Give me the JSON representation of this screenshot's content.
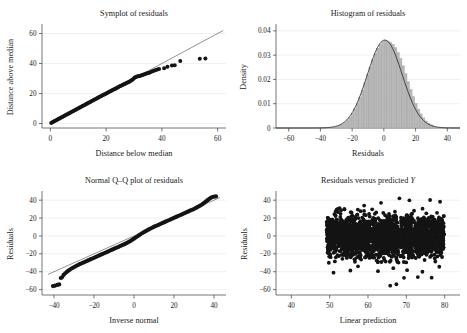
{
  "figure": {
    "background": "#ffffff",
    "point_color": "#141414",
    "bar_color": "#b8b8b8",
    "bar_edge": "#9a9a9a",
    "line_color": "#4a4a4a"
  },
  "panels": {
    "symplot": {
      "title": "Symplot of residuals"
    },
    "histogram": {
      "title": "Histogram of residuals"
    },
    "qq": {
      "title": "Normal Q–Q plot of residuals"
    },
    "scatter": {
      "title_before": "Residuals versus predicted ",
      "title_italic": "Y"
    }
  },
  "chart_data": [
    {
      "type": "scatter",
      "name": "symplot",
      "title": "Symplot of residuals",
      "xlabel": "Distance below median",
      "ylabel": "Distance above median",
      "xlim": [
        -3,
        63
      ],
      "ylim": [
        -3,
        65
      ],
      "xticks": [
        0,
        20,
        40,
        60
      ],
      "yticks": [
        0,
        20,
        40,
        60
      ],
      "grid": true,
      "reference_line": {
        "slope": 1,
        "intercept": 0,
        "label": "y = x"
      },
      "points": [
        [
          0.3,
          0.4
        ],
        [
          0.7,
          0.8
        ],
        [
          1.1,
          1.2
        ],
        [
          1.5,
          1.6
        ],
        [
          1.9,
          2.0
        ],
        [
          2.3,
          2.4
        ],
        [
          2.7,
          2.8
        ],
        [
          3.1,
          3.2
        ],
        [
          3.5,
          3.6
        ],
        [
          3.9,
          4.0
        ],
        [
          4.3,
          4.4
        ],
        [
          4.7,
          4.8
        ],
        [
          5.1,
          5.2
        ],
        [
          5.5,
          5.6
        ],
        [
          5.9,
          6.0
        ],
        [
          6.3,
          6.4
        ],
        [
          6.7,
          6.8
        ],
        [
          7.1,
          7.2
        ],
        [
          7.5,
          7.6
        ],
        [
          7.9,
          8.0
        ],
        [
          8.3,
          8.4
        ],
        [
          8.7,
          8.8
        ],
        [
          9.1,
          9.2
        ],
        [
          9.5,
          9.6
        ],
        [
          9.9,
          10.0
        ],
        [
          10.3,
          10.4
        ],
        [
          10.7,
          10.8
        ],
        [
          11.1,
          11.2
        ],
        [
          11.5,
          11.6
        ],
        [
          11.9,
          12.0
        ],
        [
          12.3,
          12.4
        ],
        [
          12.7,
          12.8
        ],
        [
          13.1,
          13.2
        ],
        [
          13.5,
          13.6
        ],
        [
          13.9,
          14.0
        ],
        [
          14.3,
          14.4
        ],
        [
          14.7,
          14.8
        ],
        [
          15.1,
          15.2
        ],
        [
          15.5,
          15.6
        ],
        [
          15.9,
          16.0
        ],
        [
          16.3,
          16.4
        ],
        [
          16.7,
          16.8
        ],
        [
          17.1,
          17.2
        ],
        [
          17.5,
          17.6
        ],
        [
          17.9,
          18.0
        ],
        [
          18.3,
          18.4
        ],
        [
          18.7,
          18.8
        ],
        [
          19.1,
          19.2
        ],
        [
          19.5,
          19.5
        ],
        [
          19.9,
          19.9
        ],
        [
          20.3,
          20.3
        ],
        [
          20.7,
          20.7
        ],
        [
          21.1,
          21.1
        ],
        [
          21.5,
          21.5
        ],
        [
          21.9,
          21.9
        ],
        [
          22.3,
          22.3
        ],
        [
          22.7,
          22.7
        ],
        [
          23.1,
          23.0
        ],
        [
          23.5,
          23.4
        ],
        [
          23.9,
          23.8
        ],
        [
          24.3,
          24.2
        ],
        [
          24.7,
          24.6
        ],
        [
          25.1,
          25.0
        ],
        [
          25.5,
          25.3
        ],
        [
          25.9,
          25.7
        ],
        [
          26.3,
          26.1
        ],
        [
          26.7,
          26.4
        ],
        [
          27.1,
          26.8
        ],
        [
          27.5,
          27.2
        ],
        [
          27.9,
          27.5
        ],
        [
          28.3,
          27.9
        ],
        [
          28.7,
          28.3
        ],
        [
          29.1,
          28.8
        ],
        [
          29.5,
          29.4
        ],
        [
          29.9,
          30.0
        ],
        [
          30.3,
          30.6
        ],
        [
          30.7,
          31.0
        ],
        [
          31.1,
          31.3
        ],
        [
          31.5,
          31.5
        ],
        [
          31.9,
          31.7
        ],
        [
          32.3,
          31.9
        ],
        [
          32.7,
          32.1
        ],
        [
          33.1,
          32.4
        ],
        [
          33.5,
          32.7
        ],
        [
          34.0,
          33.0
        ],
        [
          34.5,
          33.3
        ],
        [
          35.0,
          33.6
        ],
        [
          35.5,
          33.9
        ],
        [
          36.0,
          34.3
        ],
        [
          36.6,
          34.8
        ],
        [
          37.2,
          35.2
        ],
        [
          37.8,
          35.6
        ],
        [
          38.4,
          36.0
        ],
        [
          39.0,
          36.4
        ],
        [
          40.8,
          36.9
        ],
        [
          42.0,
          37.9
        ],
        [
          43.6,
          38.6
        ],
        [
          44.6,
          38.9
        ],
        [
          46.6,
          41.6
        ],
        [
          53.6,
          43.2
        ],
        [
          55.6,
          43.4
        ]
      ]
    },
    {
      "type": "bar",
      "name": "histogram",
      "title": "Histogram of residuals",
      "xlabel": "Residuals",
      "ylabel": "Density",
      "xlim": [
        -68,
        48
      ],
      "ylim": [
        0,
        0.042
      ],
      "xticks": [
        -60,
        -40,
        -20,
        0,
        20,
        40
      ],
      "yticks": [
        0,
        0.01,
        0.02,
        0.03,
        0.04
      ],
      "ytick_labels": [
        "0",
        "0.01",
        "0.02",
        "0.03",
        "0.04"
      ],
      "grid": true,
      "bin_width": 1.6,
      "bin_centers": [
        -31,
        -29.4,
        -27.8,
        -26.2,
        -24.6,
        -23,
        -21.4,
        -19.8,
        -18.2,
        -16.6,
        -15,
        -13.4,
        -11.8,
        -10.2,
        -8.6,
        -7,
        -5.4,
        -3.8,
        -2.2,
        -0.6,
        1,
        2.6,
        4.2,
        5.8,
        7.4,
        9,
        10.6,
        12.2,
        13.8,
        15.4,
        17,
        18.6,
        20.2,
        21.8,
        23.4,
        25,
        26.6,
        28.2,
        29.8,
        31.4
      ],
      "densities": [
        0.0004,
        0.0007,
        0.0011,
        0.0016,
        0.0023,
        0.0033,
        0.0045,
        0.006,
        0.0079,
        0.0101,
        0.0127,
        0.0156,
        0.0187,
        0.0219,
        0.0251,
        0.0281,
        0.0307,
        0.0328,
        0.0345,
        0.0356,
        0.0362,
        0.0358,
        0.0352,
        0.0345,
        0.0331,
        0.0311,
        0.0286,
        0.0256,
        0.0224,
        0.0191,
        0.0159,
        0.0129,
        0.0102,
        0.0078,
        0.0058,
        0.0042,
        0.0029,
        0.002,
        0.0013,
        0.0008
      ],
      "overlay": {
        "type": "normal_density",
        "mean": 0.6,
        "sd": 11.0,
        "peak": 0.0362
      }
    },
    {
      "type": "scatter",
      "name": "qq",
      "title": "Normal Q–Q plot of residuals",
      "xlabel": "Inverse normal",
      "ylabel": "Residuals",
      "xlim": [
        -46,
        46
      ],
      "ylim": [
        -66,
        48
      ],
      "xticks": [
        -40,
        -20,
        0,
        20,
        40
      ],
      "yticks": [
        -60,
        -40,
        -20,
        0,
        20,
        40
      ],
      "grid": true,
      "reference_line": {
        "slope": 1.0,
        "intercept": 0,
        "label": "45-degree reference"
      },
      "points": [
        [
          -40.5,
          -56.0
        ],
        [
          -39.5,
          -55.6
        ],
        [
          -38.2,
          -54.6
        ],
        [
          -37.4,
          -54.2
        ],
        [
          -36.6,
          -47.0
        ],
        [
          -36.0,
          -46.2
        ],
        [
          -35.2,
          -43.6
        ],
        [
          -34.4,
          -41.8
        ],
        [
          -33.6,
          -40.2
        ],
        [
          -32.8,
          -38.8
        ],
        [
          -32.0,
          -37.6
        ],
        [
          -31.2,
          -36.4
        ],
        [
          -30.4,
          -35.4
        ],
        [
          -29.6,
          -34.4
        ],
        [
          -28.8,
          -33.4
        ],
        [
          -28.0,
          -32.5
        ],
        [
          -27.2,
          -31.6
        ],
        [
          -26.4,
          -30.8
        ],
        [
          -25.6,
          -30.0
        ],
        [
          -24.8,
          -29.2
        ],
        [
          -24.0,
          -28.4
        ],
        [
          -23.2,
          -27.6
        ],
        [
          -22.4,
          -26.8
        ],
        [
          -21.6,
          -26.0
        ],
        [
          -20.8,
          -25.2
        ],
        [
          -20.0,
          -24.4
        ],
        [
          -19.2,
          -23.6
        ],
        [
          -18.4,
          -22.8
        ],
        [
          -17.6,
          -22.0
        ],
        [
          -16.8,
          -21.2
        ],
        [
          -16.0,
          -20.4
        ],
        [
          -15.2,
          -19.6
        ],
        [
          -14.4,
          -18.8
        ],
        [
          -13.6,
          -18.0
        ],
        [
          -12.8,
          -17.2
        ],
        [
          -12.0,
          -16.4
        ],
        [
          -11.2,
          -15.6
        ],
        [
          -10.4,
          -14.8
        ],
        [
          -9.6,
          -14.0
        ],
        [
          -8.8,
          -13.2
        ],
        [
          -8.0,
          -12.4
        ],
        [
          -7.2,
          -11.6
        ],
        [
          -6.4,
          -10.8
        ],
        [
          -5.6,
          -10.0
        ],
        [
          -4.8,
          -9.2
        ],
        [
          -4.0,
          -8.4
        ],
        [
          -3.2,
          -7.4
        ],
        [
          -2.4,
          -6.4
        ],
        [
          -1.6,
          -5.4
        ],
        [
          -0.8,
          -4.2
        ],
        [
          0,
          -3.0
        ],
        [
          0.8,
          -1.8
        ],
        [
          1.6,
          -0.6
        ],
        [
          2.4,
          0.6
        ],
        [
          3.2,
          1.8
        ],
        [
          4.0,
          3.0
        ],
        [
          4.8,
          4.0
        ],
        [
          5.6,
          5.0
        ],
        [
          6.4,
          6.0
        ],
        [
          7.2,
          7.0
        ],
        [
          8.0,
          8.0
        ],
        [
          8.8,
          8.9
        ],
        [
          9.6,
          9.8
        ],
        [
          10.4,
          10.6
        ],
        [
          11.2,
          11.4
        ],
        [
          12.0,
          12.2
        ],
        [
          12.8,
          13.0
        ],
        [
          13.6,
          13.8
        ],
        [
          14.4,
          14.6
        ],
        [
          15.2,
          15.4
        ],
        [
          16.0,
          16.2
        ],
        [
          16.8,
          17.0
        ],
        [
          17.6,
          17.8
        ],
        [
          18.4,
          18.6
        ],
        [
          19.2,
          19.4
        ],
        [
          20.0,
          20.2
        ],
        [
          20.8,
          21.0
        ],
        [
          21.6,
          21.8
        ],
        [
          22.4,
          22.6
        ],
        [
          23.2,
          23.4
        ],
        [
          24.0,
          24.2
        ],
        [
          24.8,
          25.0
        ],
        [
          25.6,
          25.8
        ],
        [
          26.4,
          26.6
        ],
        [
          27.2,
          27.4
        ],
        [
          28.0,
          28.2
        ],
        [
          28.8,
          29.0
        ],
        [
          29.6,
          29.8
        ],
        [
          30.4,
          30.6
        ],
        [
          31.2,
          31.6
        ],
        [
          32.0,
          32.6
        ],
        [
          32.8,
          33.6
        ],
        [
          33.6,
          34.6
        ],
        [
          34.4,
          35.8
        ],
        [
          35.2,
          37.2
        ],
        [
          36.0,
          38.6
        ],
        [
          36.8,
          40.0
        ],
        [
          37.6,
          41.4
        ],
        [
          38.4,
          42.6
        ],
        [
          39.2,
          43.4
        ],
        [
          40.2,
          44.0
        ],
        [
          41.0,
          44.2
        ]
      ]
    },
    {
      "type": "scatter",
      "name": "scatter",
      "title": "Residuals versus predicted Y",
      "xlabel": "Linear prediction",
      "ylabel": "Residuals",
      "xlim": [
        36,
        84
      ],
      "ylim": [
        -66,
        48
      ],
      "xticks": [
        40,
        50,
        60,
        70,
        80
      ],
      "yticks": [
        -60,
        -40,
        -20,
        0,
        20,
        40
      ],
      "grid": true,
      "cloud": {
        "x_range": [
          49.2,
          79.8
        ],
        "y_center": 0,
        "y_sd": 11.0,
        "n_points": 2600,
        "description": "dense homoscedastic band of residuals"
      },
      "outliers": [
        [
          51.0,
          -41.0
        ],
        [
          65.8,
          -55.6
        ],
        [
          67.4,
          -54.0
        ],
        [
          69.4,
          -46.8
        ],
        [
          73.0,
          -46.0
        ],
        [
          76.6,
          -46.6
        ],
        [
          55.4,
          -38.6
        ],
        [
          62.6,
          -39.4
        ],
        [
          70.2,
          -38.2
        ],
        [
          78.6,
          -34.4
        ],
        [
          68.2,
          42.0
        ],
        [
          70.8,
          39.8
        ],
        [
          76.2,
          40.2
        ],
        [
          78.8,
          38.2
        ],
        [
          63.4,
          37.0
        ],
        [
          59.0,
          34.0
        ],
        [
          52.6,
          31.0
        ],
        [
          57.4,
          -34.0
        ],
        [
          74.2,
          -40.0
        ],
        [
          66.6,
          -36.0
        ]
      ]
    }
  ]
}
